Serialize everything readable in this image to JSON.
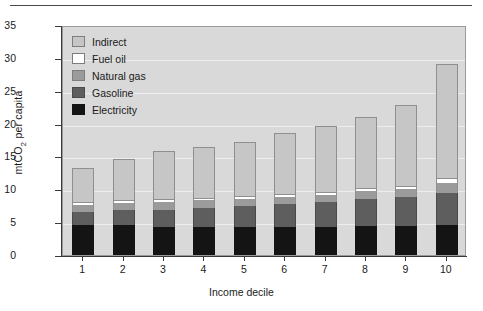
{
  "chart_data": {
    "type": "bar",
    "stacked": true,
    "title": "",
    "xlabel": "Income decile",
    "ylabel": "mtCO2 per capita",
    "ylabel_html": "mtCO<sub>2</sub> per capita",
    "categories": [
      "1",
      "2",
      "3",
      "4",
      "5",
      "6",
      "7",
      "8",
      "9",
      "10"
    ],
    "ylim": [
      0,
      35
    ],
    "yticks": [
      0,
      5,
      10,
      15,
      20,
      25,
      30,
      35
    ],
    "grid": true,
    "legend_position": "top-left inside plot",
    "series": [
      {
        "name": "Electricity",
        "color": "#141414",
        "values": [
          4.6,
          4.5,
          4.3,
          4.3,
          4.3,
          4.3,
          4.3,
          4.4,
          4.4,
          4.5
        ]
      },
      {
        "name": "Gasoline",
        "color": "#5e5e5e",
        "values": [
          2.0,
          2.3,
          2.6,
          2.9,
          3.2,
          3.5,
          3.8,
          4.1,
          4.4,
          5.0
        ]
      },
      {
        "name": "Natural gas",
        "color": "#9b9b9b",
        "values": [
          1.0,
          1.1,
          1.1,
          1.1,
          1.1,
          1.1,
          1.1,
          1.2,
          1.2,
          1.5
        ]
      },
      {
        "name": "Fuel oil",
        "color": "#ffffff",
        "values": [
          0.3,
          0.3,
          0.3,
          0.3,
          0.3,
          0.3,
          0.3,
          0.3,
          0.4,
          0.5
        ]
      },
      {
        "name": "Indirect",
        "color": "#c6c6c6",
        "values": [
          5.4,
          6.4,
          7.5,
          7.9,
          8.3,
          9.3,
          10.1,
          11.0,
          12.4,
          17.5
        ]
      }
    ],
    "totals": [
      13.3,
      14.6,
      15.8,
      16.5,
      17.2,
      18.5,
      19.6,
      21.0,
      22.8,
      29.0
    ]
  },
  "legend": {
    "items": [
      {
        "label": "Indirect",
        "icon": "swatch-indirect"
      },
      {
        "label": "Fuel oil",
        "icon": "swatch-fuel-oil"
      },
      {
        "label": "Natural gas",
        "icon": "swatch-natural-gas"
      },
      {
        "label": "Gasoline",
        "icon": "swatch-gasoline"
      },
      {
        "label": "Electricity",
        "icon": "swatch-electricity"
      }
    ]
  }
}
